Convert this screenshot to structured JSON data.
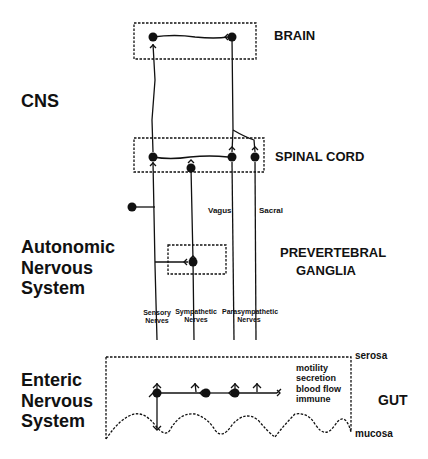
{
  "labels": {
    "brain": "BRAIN",
    "spinal_cord": "SPINAL CORD",
    "prevertebral_line1": "PREVERTEBRAL",
    "prevertebral_line2": "GANGLIA",
    "gut": "GUT",
    "serosa": "serosa",
    "mucosa": "mucosa",
    "vagus": "Vagus",
    "sacral": "Sacral"
  },
  "sections": {
    "cns": "CNS",
    "ans_line1": "Autonomic",
    "ans_line2": "Nervous",
    "ans_line3": "System",
    "ens_line1": "Enteric",
    "ens_line2": "Nervous",
    "ens_line3": "System"
  },
  "nerves": {
    "sensory_1": "Sensory",
    "sensory_2": "Nerves",
    "sympathetic_1": "Sympathetic",
    "sympathetic_2": "Nerves",
    "parasympathetic_1": "Parasympathetic",
    "parasympathetic_2": "Nerves"
  },
  "gut_functions": [
    "motility",
    "secretion",
    "blood flow",
    "immune"
  ],
  "colors": {
    "ink": "#111111",
    "background": "#ffffff"
  }
}
